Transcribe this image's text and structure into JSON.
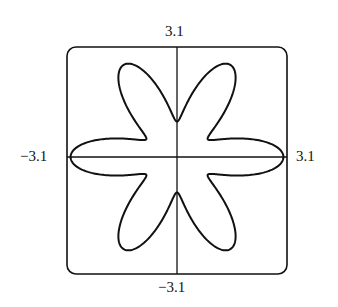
{
  "chart_data": {
    "type": "line",
    "subtype": "polar",
    "equation": "r = 1 + 2cos^2(3θ)",
    "title": "",
    "xlabel": "",
    "ylabel": "",
    "xlim": [
      -3.1,
      3.1
    ],
    "ylim": [
      -3.1,
      3.1
    ],
    "grid": false,
    "tick_labels": {
      "top": "3.1",
      "bottom": "−3.1",
      "left": "−3.1",
      "right": "3.1"
    },
    "petals": 6,
    "max_r": 3,
    "min_r": 1
  },
  "labels": {
    "top": "3.1",
    "bottom": "−3.1",
    "left": "−3.1",
    "right": "3.1"
  }
}
